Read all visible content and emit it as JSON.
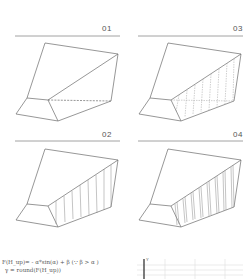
{
  "header": {
    "cropped_text": ""
  },
  "panels": [
    {
      "id": "01",
      "label": "01",
      "hatch": "none-dashed"
    },
    {
      "id": "02",
      "label": "02",
      "hatch": "sparse"
    },
    {
      "id": "03",
      "label": "03",
      "hatch": "fine-dashed"
    },
    {
      "id": "04",
      "label": "04",
      "hatch": "dense-double"
    }
  ],
  "formula": {
    "line1": "F(H_up)= - α*sin(α) + β (∵ β > α   )",
    "line2": "γ = round(F(H_up))"
  },
  "mini_chart": {
    "axis_label": "Y"
  },
  "colors": {
    "stroke": "#6a6a6a",
    "hatch": "#9a9a9a",
    "rule": "#8a8a8a",
    "grid": "#dddddd",
    "axis": "#444444"
  }
}
